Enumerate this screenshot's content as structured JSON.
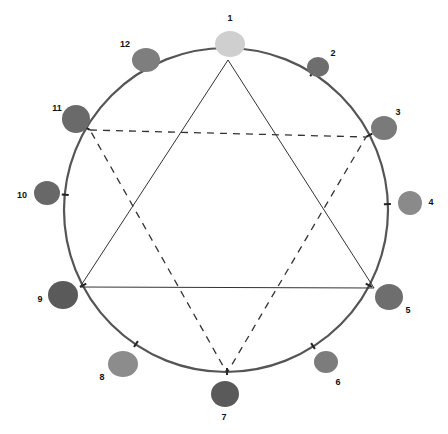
{
  "diagram": {
    "type": "color-wheel-hexagram",
    "circle": {
      "cx": 226,
      "cy": 210,
      "r": 162,
      "stroke": "#555555"
    },
    "positions": [
      {
        "n": "1",
        "label": "1",
        "blob": {
          "x": 230,
          "y": 44,
          "rx": 15,
          "ry": 13,
          "color": "#cfcfcf"
        },
        "label_pos": {
          "x": 230,
          "y": 18
        },
        "tick": {
          "x": 228,
          "y": 60
        }
      },
      {
        "n": "2",
        "label": "2",
        "blob": {
          "x": 318,
          "y": 67,
          "rx": 11,
          "ry": 10,
          "color": "#6e6e6e"
        },
        "label_pos": {
          "x": 333,
          "y": 53
        },
        "tick": {
          "x": 306,
          "y": 83
        }
      },
      {
        "n": "3",
        "label": "3",
        "blob": {
          "x": 384,
          "y": 128,
          "rx": 13,
          "ry": 12,
          "color": "#7a7a7a"
        },
        "label_pos": {
          "x": 398,
          "y": 112
        },
        "tick": {
          "x": 366,
          "y": 137
        }
      },
      {
        "n": "4",
        "label": "4",
        "blob": {
          "x": 410,
          "y": 203,
          "rx": 12,
          "ry": 12,
          "color": "#8a8a8a"
        },
        "label_pos": {
          "x": 431,
          "y": 202
        },
        "tick": {
          "x": 388,
          "y": 204
        }
      },
      {
        "n": "5",
        "label": "5",
        "blob": {
          "x": 389,
          "y": 297,
          "rx": 14,
          "ry": 13,
          "color": "#6e6e6e"
        },
        "label_pos": {
          "x": 408,
          "y": 310
        },
        "tick": {
          "x": 374,
          "y": 288
        }
      },
      {
        "n": "6",
        "label": "6",
        "blob": {
          "x": 326,
          "y": 362,
          "rx": 12,
          "ry": 11,
          "color": "#7c7c7c"
        },
        "label_pos": {
          "x": 338,
          "y": 382
        },
        "tick": {
          "x": 313,
          "y": 346
        }
      },
      {
        "n": "7",
        "label": "7",
        "blob": {
          "x": 225,
          "y": 394,
          "rx": 14,
          "ry": 13,
          "color": "#5a5a5a"
        },
        "label_pos": {
          "x": 224,
          "y": 417
        },
        "tick": {
          "x": 227,
          "y": 373
        }
      },
      {
        "n": "8",
        "label": "8",
        "blob": {
          "x": 123,
          "y": 364,
          "rx": 15,
          "ry": 13,
          "color": "#8c8c8c"
        },
        "label_pos": {
          "x": 102,
          "y": 377
        },
        "tick": {
          "x": 136,
          "y": 344
        }
      },
      {
        "n": "9",
        "label": "9",
        "blob": {
          "x": 63,
          "y": 295,
          "rx": 15,
          "ry": 14,
          "color": "#5a5a5a"
        },
        "label_pos": {
          "x": 40,
          "y": 299
        },
        "tick": {
          "x": 80,
          "y": 287
        }
      },
      {
        "n": "10",
        "label": "10",
        "blob": {
          "x": 47,
          "y": 193,
          "rx": 13,
          "ry": 12,
          "color": "#686868"
        },
        "label_pos": {
          "x": 22,
          "y": 195
        },
        "tick": {
          "x": 68,
          "y": 195
        }
      },
      {
        "n": "11",
        "label": "11",
        "blob": {
          "x": 76,
          "y": 119,
          "rx": 14,
          "ry": 14,
          "color": "#6a6a6a"
        },
        "label_pos": {
          "x": 57,
          "y": 108
        },
        "tick": {
          "x": 90,
          "y": 130
        }
      },
      {
        "n": "12",
        "label": "12",
        "blob": {
          "x": 146,
          "y": 60,
          "rx": 14,
          "ry": 12,
          "color": "#7e7e7e"
        },
        "label_pos": {
          "x": 125,
          "y": 44
        },
        "tick": {
          "x": 156,
          "y": 76
        }
      }
    ],
    "solid_triangle": {
      "vertices": [
        "1",
        "5",
        "9"
      ],
      "stroke": "#333333",
      "style": "solid"
    },
    "dashed_triangle": {
      "vertices": [
        "11",
        "3",
        "7"
      ],
      "stroke": "#333333",
      "style": "dashed"
    }
  }
}
